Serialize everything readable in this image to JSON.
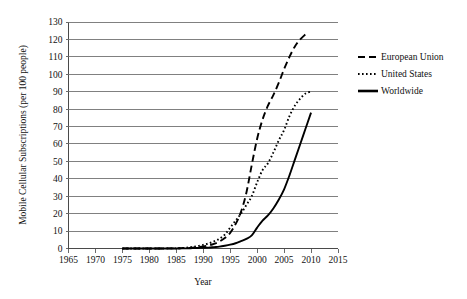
{
  "chart_data": {
    "type": "line",
    "title": "",
    "xlabel": "Year",
    "ylabel": "Mobile Cellular Subscriptions (per 100 people)",
    "xlim": [
      1965,
      2015
    ],
    "ylim": [
      0,
      130
    ],
    "xticks": [
      1965,
      1970,
      1975,
      1980,
      1985,
      1990,
      1995,
      2000,
      2005,
      2010,
      2015
    ],
    "yticks": [
      0,
      10,
      20,
      30,
      40,
      50,
      60,
      70,
      80,
      90,
      100,
      110,
      120,
      130
    ],
    "grid": "horizontal",
    "legend_position": "upper-right-outside",
    "series": [
      {
        "name": "European Union",
        "style": "dashed",
        "x": [
          1975,
          1980,
          1985,
          1986,
          1987,
          1988,
          1989,
          1990,
          1991,
          1992,
          1993,
          1994,
          1995,
          1996,
          1997,
          1998,
          1999,
          2000,
          2001,
          2002,
          2003,
          2004,
          2005,
          2006,
          2007,
          2008,
          2009
        ],
        "values": [
          0,
          0,
          0.1,
          0.2,
          0.3,
          0.5,
          0.8,
          1.2,
          1.8,
          2.7,
          4.0,
          6.0,
          9.0,
          14.0,
          21.0,
          32.0,
          48.0,
          63.0,
          74.0,
          82.0,
          88.0,
          95.0,
          103.0,
          110.0,
          116.0,
          120.0,
          123.0
        ]
      },
      {
        "name": "United States",
        "style": "dotted",
        "x": [
          1975,
          1980,
          1985,
          1986,
          1987,
          1988,
          1989,
          1990,
          1991,
          1992,
          1993,
          1994,
          1995,
          1996,
          1997,
          1998,
          1999,
          2000,
          2001,
          2002,
          2003,
          2004,
          2005,
          2006,
          2007,
          2008,
          2009,
          2010
        ],
        "values": [
          0,
          0,
          0.1,
          0.3,
          0.5,
          0.9,
          1.4,
          2.1,
          2.9,
          4.1,
          5.6,
          8.0,
          12.0,
          16.0,
          20.0,
          25.0,
          30.0,
          38.0,
          45.0,
          49.0,
          55.0,
          62.0,
          68.0,
          76.0,
          82.0,
          86.0,
          89.0,
          90.0
        ]
      },
      {
        "name": "Worldwide",
        "style": "solid",
        "x": [
          1975,
          1980,
          1985,
          1986,
          1987,
          1988,
          1989,
          1990,
          1991,
          1992,
          1993,
          1994,
          1995,
          1996,
          1997,
          1998,
          1999,
          2000,
          2001,
          2002,
          2003,
          2004,
          2005,
          2006,
          2007,
          2008,
          2009,
          2010
        ],
        "values": [
          0,
          0,
          0.0,
          0.1,
          0.1,
          0.2,
          0.3,
          0.4,
          0.5,
          0.8,
          1.1,
          1.6,
          2.2,
          3.0,
          4.2,
          5.5,
          7.5,
          12.0,
          16.0,
          19.0,
          23.0,
          28.0,
          34.0,
          42.0,
          51.0,
          60.0,
          69.0,
          78.0
        ]
      }
    ]
  },
  "legend": {
    "items": [
      {
        "label": "European Union",
        "style": "dashed"
      },
      {
        "label": "United States",
        "style": "dotted"
      },
      {
        "label": "Worldwide",
        "style": "solid"
      }
    ]
  }
}
